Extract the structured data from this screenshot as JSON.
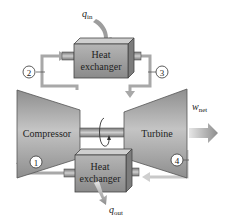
{
  "diagram": {
    "type": "Brayton cycle (closed gas-turbine) schematic",
    "components": {
      "heat_exchanger_top": {
        "line1": "Heat",
        "line2": "exchanger"
      },
      "heat_exchanger_bottom": {
        "line1": "Heat",
        "line2": "exchanger"
      },
      "compressor": {
        "label": "Compressor"
      },
      "turbine": {
        "label": "Turbine"
      }
    },
    "energy_labels": {
      "q_in": {
        "symbol": "q",
        "subscript": "in"
      },
      "q_out": {
        "symbol": "q",
        "subscript": "out"
      },
      "w_net": {
        "symbol": "w",
        "subscript": "net"
      }
    },
    "states": [
      {
        "id": "1",
        "label": "1"
      },
      {
        "id": "2",
        "label": "2"
      },
      {
        "id": "3",
        "label": "3"
      },
      {
        "id": "4",
        "label": "4"
      }
    ],
    "colors": {
      "box_front": "#9a9a9a",
      "box_top": "#c9c9c9",
      "box_side": "#7a7a7a",
      "machine_fill": "#a8a8a8",
      "pipe_line": "#a0a0a0",
      "energy_arrow": "#9d9d9d",
      "text": "#222222"
    }
  }
}
